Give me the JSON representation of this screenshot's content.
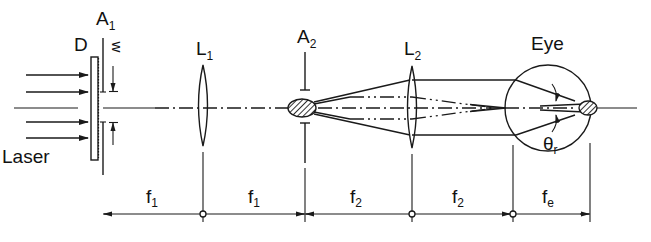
{
  "diagram": {
    "type": "optical-setup",
    "labels": {
      "laser": "Laser",
      "diffuser": "D",
      "aperture1": "A",
      "aperture1_sub": "1",
      "aperture_width": "w",
      "lens1": "L",
      "lens1_sub": "1",
      "aperture2": "A",
      "aperture2_sub": "2",
      "lens2": "L",
      "lens2_sub": "2",
      "eye": "Eye",
      "angle": "θ",
      "angle_sub": "r"
    },
    "dimensions": [
      {
        "label": "f",
        "sub": "1"
      },
      {
        "label": "f",
        "sub": "1"
      },
      {
        "label": "f",
        "sub": "2"
      },
      {
        "label": "f",
        "sub": "2"
      },
      {
        "label": "f",
        "sub": "e"
      }
    ],
    "colors": {
      "ink": "#1a1a1a",
      "background": "#ffffff"
    }
  }
}
